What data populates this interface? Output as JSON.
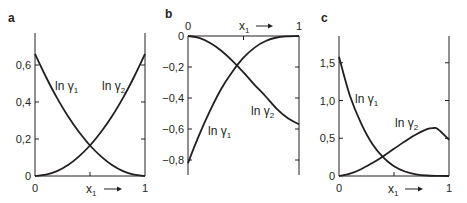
{
  "chart_data": [
    {
      "type": "line",
      "panel_label": "a",
      "xlabel": "x1",
      "xlabel_arrow": "→",
      "ylabel": "",
      "x_ticks": [
        "0",
        "1"
      ],
      "y_ticks": [
        "0",
        "0,2",
        "0,4",
        "0,6"
      ],
      "xlim": [
        0,
        1
      ],
      "ylim": [
        0,
        0.75
      ],
      "grid": false,
      "series": [
        {
          "name": "ln γ1",
          "x": [
            0,
            0.1,
            0.2,
            0.3,
            0.4,
            0.5,
            0.6,
            0.7,
            0.8,
            0.9,
            1.0
          ],
          "values": [
            0.66,
            0.535,
            0.422,
            0.323,
            0.238,
            0.165,
            0.106,
            0.059,
            0.026,
            0.007,
            0.0
          ]
        },
        {
          "name": "ln γ2",
          "x": [
            0,
            0.1,
            0.2,
            0.3,
            0.4,
            0.5,
            0.6,
            0.7,
            0.8,
            0.9,
            1.0
          ],
          "values": [
            0.0,
            0.007,
            0.026,
            0.059,
            0.106,
            0.165,
            0.238,
            0.323,
            0.422,
            0.535,
            0.66
          ]
        }
      ],
      "annotations": [
        {
          "text": "ln γ1",
          "x": 0.22,
          "y": 0.48
        },
        {
          "text": "ln γ2",
          "x": 0.62,
          "y": 0.48
        }
      ]
    },
    {
      "type": "line",
      "panel_label": "b",
      "xlabel": "x1",
      "xlabel_arrow": "→",
      "xlabel_position": "top",
      "ylabel": "",
      "x_ticks": [
        "0",
        "1"
      ],
      "y_ticks": [
        "0",
        "−0,2",
        "−0,4",
        "−0,6",
        "−0,8"
      ],
      "xlim": [
        0,
        1
      ],
      "ylim": [
        -0.9,
        0
      ],
      "grid": false,
      "series": [
        {
          "name": "ln γ1",
          "x": [
            0,
            0.1,
            0.2,
            0.3,
            0.4,
            0.5,
            0.6,
            0.7,
            0.8,
            0.9,
            1.0
          ],
          "values": [
            -0.82,
            -0.64,
            -0.48,
            -0.34,
            -0.23,
            -0.14,
            -0.075,
            -0.032,
            -0.01,
            -0.002,
            0.0
          ]
        },
        {
          "name": "ln γ2",
          "x": [
            0,
            0.1,
            0.2,
            0.3,
            0.4,
            0.5,
            0.6,
            0.7,
            0.8,
            0.9,
            1.0
          ],
          "values": [
            0.0,
            -0.012,
            -0.045,
            -0.095,
            -0.16,
            -0.235,
            -0.315,
            -0.39,
            -0.47,
            -0.53,
            -0.57
          ]
        }
      ],
      "annotations": [
        {
          "text": "ln γ1",
          "x": 0.2,
          "y": -0.62
        },
        {
          "text": "ln γ2",
          "x": 0.6,
          "y": -0.5
        }
      ]
    },
    {
      "type": "line",
      "panel_label": "c",
      "xlabel": "x1",
      "xlabel_arrow": "→",
      "ylabel": "",
      "x_ticks": [
        "0",
        "1"
      ],
      "y_ticks": [
        "0",
        "0,5",
        "1,0",
        "1,5"
      ],
      "xlim": [
        0,
        1
      ],
      "ylim": [
        0,
        1.85
      ],
      "grid": false,
      "series": [
        {
          "name": "ln γ1",
          "x": [
            0,
            0.1,
            0.2,
            0.3,
            0.4,
            0.5,
            0.6,
            0.7,
            0.8,
            0.9,
            1.0
          ],
          "values": [
            1.58,
            1.06,
            0.7,
            0.43,
            0.25,
            0.13,
            0.06,
            0.022,
            0.006,
            0.001,
            0.0
          ]
        },
        {
          "name": "ln γ2",
          "x": [
            0,
            0.1,
            0.2,
            0.3,
            0.4,
            0.5,
            0.6,
            0.7,
            0.8,
            0.85,
            0.9,
            1.0
          ],
          "values": [
            0.0,
            0.03,
            0.09,
            0.17,
            0.26,
            0.36,
            0.46,
            0.55,
            0.62,
            0.635,
            0.62,
            0.48
          ]
        }
      ],
      "annotations": [
        {
          "text": "ln γ1",
          "x": 0.18,
          "y": 1.02
        },
        {
          "text": "ln γ2",
          "x": 0.53,
          "y": 0.68
        }
      ]
    }
  ]
}
